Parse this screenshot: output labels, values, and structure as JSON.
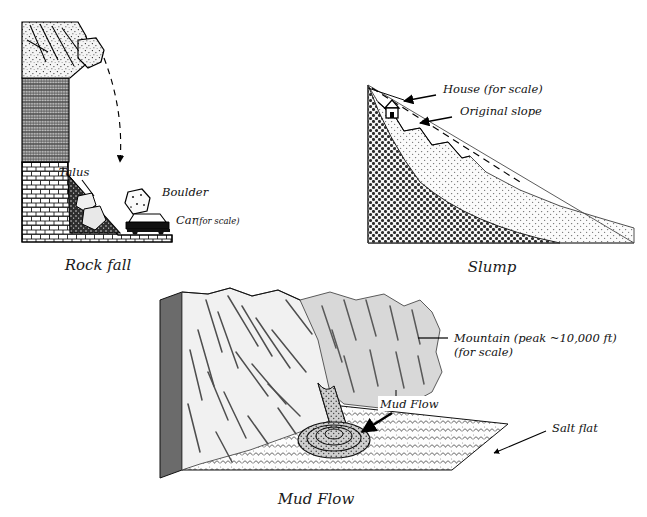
{
  "figure": {
    "title_visible": false,
    "background_color": "#ffffff",
    "ink_color": "#000000",
    "panels": [
      {
        "id": "rock-fall",
        "caption": "Rock fall",
        "labels": [
          {
            "name": "talus",
            "text": "Talus"
          },
          {
            "name": "boulder",
            "text": "Boulder"
          },
          {
            "name": "car",
            "text": "Car"
          },
          {
            "name": "car-scale",
            "text": "(for scale)"
          }
        ],
        "strata": [
          {
            "name": "caprock-jointed",
            "fill": "#f2f2f2",
            "pattern": "speckle-with-joint-lines"
          },
          {
            "name": "middle-shale",
            "fill": "#b8b8b8",
            "pattern": "fine-crosshatch"
          },
          {
            "name": "lower-bedrock",
            "fill": "#ffffff",
            "pattern": "brick"
          },
          {
            "name": "talus-apron",
            "fill": "#2b2b2b",
            "pattern": "dense-stipple"
          }
        ],
        "annotations": {
          "fall_path": "dashed-arc-arrow",
          "arrow_head": "down"
        }
      },
      {
        "id": "slump",
        "caption": "Slump",
        "labels": [
          {
            "name": "house",
            "text": "House (for scale)"
          },
          {
            "name": "original-slope",
            "text": "Original slope"
          }
        ],
        "strata": [
          {
            "name": "bedrock-dark",
            "fill": "#4a4a4a",
            "pattern": "dark-dense-stipple"
          },
          {
            "name": "slumped-mass",
            "fill": "#d9d9d9",
            "pattern": "light-stipple"
          }
        ],
        "annotations": {
          "original_slope_line": "dashed",
          "scarp_steps": 3,
          "arrows": 2
        }
      },
      {
        "id": "mud-flow",
        "caption": "Mud Flow",
        "labels": [
          {
            "name": "mountain",
            "text": "Mountain (peak ~10,000 ft)"
          },
          {
            "name": "mountain-scale",
            "text": "(for scale)"
          },
          {
            "name": "mud-flow",
            "text": "Mud Flow"
          },
          {
            "name": "salt-flat",
            "text": "Salt flat"
          }
        ],
        "strata": [
          {
            "name": "mountain-face-lit",
            "fill": "#f0f0f0",
            "pattern": "gully-lines"
          },
          {
            "name": "mountain-face-shaded",
            "fill": "#d6d6d6",
            "pattern": "gully-lines"
          },
          {
            "name": "block-side",
            "fill": "#6e6e6e",
            "pattern": "solid"
          },
          {
            "name": "salt-flat-plain",
            "fill": "#fafafa",
            "pattern": "scale-chevron"
          },
          {
            "name": "mudflow-lobe",
            "fill": "#c9c9c9",
            "pattern": "stipple-ridges"
          }
        ],
        "annotations": {
          "leader_line": "straight",
          "arrows": 2
        }
      }
    ]
  }
}
